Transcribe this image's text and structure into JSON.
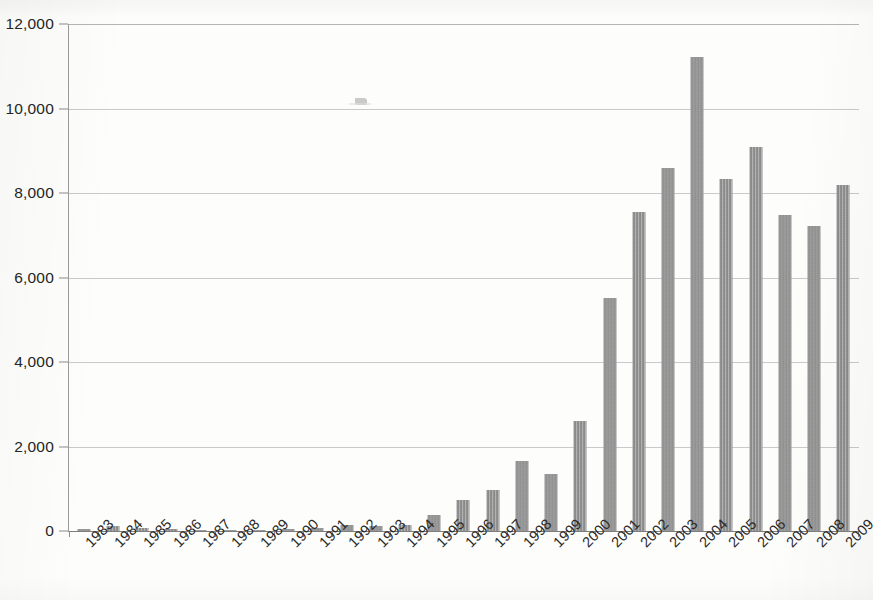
{
  "chart_data": {
    "type": "bar",
    "title": "",
    "xlabel": "",
    "ylabel": "",
    "ylim": [
      0,
      12000
    ],
    "ytick_labels": [
      "0",
      "2,000",
      "4,000",
      "6,000",
      "8,000",
      "10,000",
      "12,000"
    ],
    "ytick_values": [
      0,
      2000,
      4000,
      6000,
      8000,
      10000,
      12000
    ],
    "grid": "horizontal",
    "legend": "none",
    "bar_color": "#8d8d8d",
    "categories": [
      "1983",
      "1984",
      "1985",
      "1986",
      "1987",
      "1988",
      "1989",
      "1990",
      "1991",
      "1992",
      "1993",
      "1994",
      "1995",
      "1996",
      "1997",
      "1998",
      "1999",
      "2000",
      "2001",
      "2002",
      "2003",
      "2004",
      "2005",
      "2006",
      "2007",
      "2008",
      "2009"
    ],
    "values": [
      50,
      110,
      60,
      40,
      25,
      25,
      30,
      55,
      75,
      150,
      120,
      135,
      390,
      730,
      960,
      1660,
      1360,
      2600,
      5520,
      7540,
      8600,
      11220,
      8320,
      9080,
      7490,
      7220,
      8180
    ]
  },
  "annotations": {
    "scan_artifact": "scan-smudge"
  }
}
